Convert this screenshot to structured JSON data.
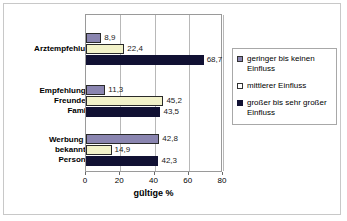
{
  "chart_data": {
    "type": "bar",
    "orientation": "horizontal",
    "title": "",
    "xlabel": "gültige %",
    "ylabel": "",
    "xlim": [
      0,
      80
    ],
    "xticks": [
      "0",
      "20",
      "40",
      "60",
      "80"
    ],
    "grid": true,
    "legend_position": "right",
    "categories": [
      "Arztempfehlung",
      "Empfehlungen Freunde o. Familie",
      "Werbung m. bekannten Personen"
    ],
    "category_lines": [
      [
        "Arztempfehlung"
      ],
      [
        "Empfehlungen",
        "Freunde o.",
        "Familie"
      ],
      [
        "Werbung m.",
        "bekannten",
        "Personen"
      ]
    ],
    "series": [
      {
        "name": "geringer bis keinen Einfluss",
        "color": "#8a85b0",
        "values": [
          8.9,
          11.3,
          42.8
        ],
        "labels": [
          "8,9",
          "11,3",
          "42,8"
        ]
      },
      {
        "name": "mittlerer Einfluss",
        "color": "#f2f2c9",
        "values": [
          22.4,
          45.2,
          14.9
        ],
        "labels": [
          "22,4",
          "45,2",
          "14,9"
        ]
      },
      {
        "name": "großer bis sehr großer Einfluss",
        "color": "#111133",
        "values": [
          68.7,
          43.5,
          42.3
        ],
        "labels": [
          "68,7",
          "43,5",
          "42,3"
        ]
      }
    ]
  },
  "legend": {
    "items": [
      {
        "label": "geringer bis keinen Einfluss",
        "swatch": "purple-swatch"
      },
      {
        "label": "mittlerer Einfluss",
        "swatch": "white-swatch"
      },
      {
        "label": "großer bis sehr großer Einfluss",
        "swatch": "navy-swatch"
      }
    ]
  },
  "axis": {
    "x_title": "gültige %",
    "x_tick_labels": [
      "0",
      "20",
      "40",
      "60",
      "80"
    ]
  }
}
